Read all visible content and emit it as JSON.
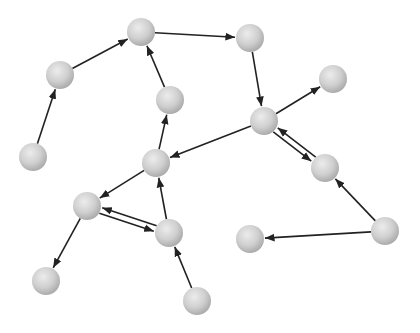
{
  "diagram": {
    "type": "directed-graph",
    "node_radius": 14,
    "colors": {
      "background": "#ffffff",
      "node_light": "#e6e6e6",
      "node_mid": "#cdcdcd",
      "node_dark": "#a9a9a9",
      "edge": "#222222"
    },
    "nodes": [
      {
        "id": "A",
        "x": 33,
        "y": 157
      },
      {
        "id": "B",
        "x": 60,
        "y": 75
      },
      {
        "id": "C",
        "x": 141,
        "y": 32
      },
      {
        "id": "D",
        "x": 170,
        "y": 100
      },
      {
        "id": "E",
        "x": 156,
        "y": 163
      },
      {
        "id": "F",
        "x": 250,
        "y": 38
      },
      {
        "id": "G",
        "x": 264,
        "y": 121
      },
      {
        "id": "H",
        "x": 333,
        "y": 79
      },
      {
        "id": "I",
        "x": 325,
        "y": 168
      },
      {
        "id": "J",
        "x": 87,
        "y": 206
      },
      {
        "id": "K",
        "x": 169,
        "y": 233
      },
      {
        "id": "L",
        "x": 46,
        "y": 281
      },
      {
        "id": "M",
        "x": 197,
        "y": 301
      },
      {
        "id": "N",
        "x": 385,
        "y": 231
      },
      {
        "id": "O",
        "x": 250,
        "y": 239
      }
    ],
    "edges": [
      {
        "from": "A",
        "to": "B"
      },
      {
        "from": "B",
        "to": "C"
      },
      {
        "from": "C",
        "to": "F"
      },
      {
        "from": "D",
        "to": "C"
      },
      {
        "from": "E",
        "to": "D"
      },
      {
        "from": "F",
        "to": "G"
      },
      {
        "from": "G",
        "to": "E"
      },
      {
        "from": "G",
        "to": "H"
      },
      {
        "from": "G",
        "to": "I",
        "offset": 3
      },
      {
        "from": "I",
        "to": "G",
        "offset": 3
      },
      {
        "from": "N",
        "to": "I"
      },
      {
        "from": "N",
        "to": "O"
      },
      {
        "from": "E",
        "to": "J"
      },
      {
        "from": "J",
        "to": "K",
        "offset": 3
      },
      {
        "from": "K",
        "to": "J",
        "offset": 3
      },
      {
        "from": "K",
        "to": "E"
      },
      {
        "from": "J",
        "to": "L"
      },
      {
        "from": "M",
        "to": "K"
      }
    ]
  }
}
